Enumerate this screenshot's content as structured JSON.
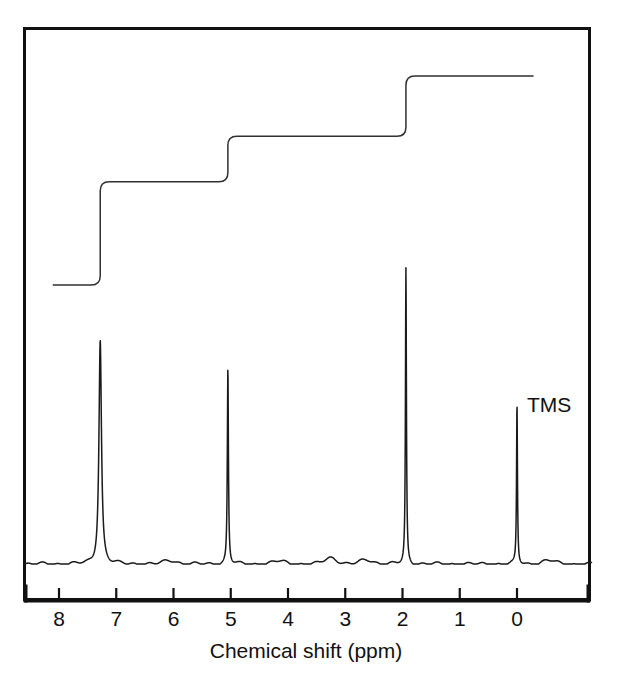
{
  "figure": {
    "title": "",
    "background_color": "#ffffff",
    "frame_color": "#111111",
    "trace_color": "#1a1a1a",
    "integral_color": "#303030"
  },
  "axis": {
    "title": "Chemical shift (ppm)",
    "tick_labels": [
      "8",
      "7",
      "6",
      "5",
      "4",
      "3",
      "2",
      "1",
      "0"
    ],
    "tick_values": [
      8,
      7,
      6,
      5,
      4,
      3,
      2,
      1,
      0
    ],
    "direction": "reversed"
  },
  "annotations": [
    {
      "label": "TMS",
      "ppm": 0.0
    }
  ],
  "chart_data": {
    "type": "line",
    "title": "",
    "subtitle": "",
    "xlabel": "Chemical shift (ppm)",
    "ylabel": "",
    "xlim": [
      8.6,
      -1.3
    ],
    "ylim": [
      0,
      1.0
    ],
    "grid": false,
    "legend": "none",
    "x_axis_reversed": true,
    "x_ticks": [
      8,
      7,
      6,
      5,
      4,
      3,
      2,
      1,
      0
    ],
    "series": [
      {
        "name": "1H NMR spectrum",
        "type": "line",
        "peaks": [
          {
            "ppm": 7.28,
            "height": 0.63,
            "width_ppm": 0.105,
            "multiplicity": "singlet",
            "assignment": "aromatic H"
          },
          {
            "ppm": 5.05,
            "height": 0.55,
            "width_ppm": 0.045,
            "multiplicity": "singlet",
            "assignment": "CH2"
          },
          {
            "ppm": 1.94,
            "height": 0.83,
            "width_ppm": 0.04,
            "multiplicity": "singlet",
            "assignment": "CH3"
          },
          {
            "ppm": 0.0,
            "height": 0.45,
            "width_ppm": 0.038,
            "multiplicity": "singlet",
            "assignment": "TMS reference"
          }
        ],
        "baseline_noise": [
          {
            "ppm": 3.25,
            "height": 0.018
          },
          {
            "ppm": 2.62,
            "height": 0.012
          },
          {
            "ppm": 6.05,
            "height": 0.01
          },
          {
            "ppm": 4.15,
            "height": 0.008
          },
          {
            "ppm": -0.55,
            "height": 0.01
          }
        ]
      },
      {
        "name": "Integration trace",
        "type": "step",
        "start_ppm": 8.1,
        "end_ppm": -0.28,
        "steps": [
          {
            "ppm": 7.28,
            "rise": 0.385,
            "relative_area": 5
          },
          {
            "ppm": 5.05,
            "rise": 0.17,
            "relative_area": 2
          },
          {
            "ppm": 1.94,
            "rise": 0.225,
            "relative_area": 3
          }
        ],
        "baseline_level": 0.0,
        "total_level": 0.78
      }
    ]
  }
}
